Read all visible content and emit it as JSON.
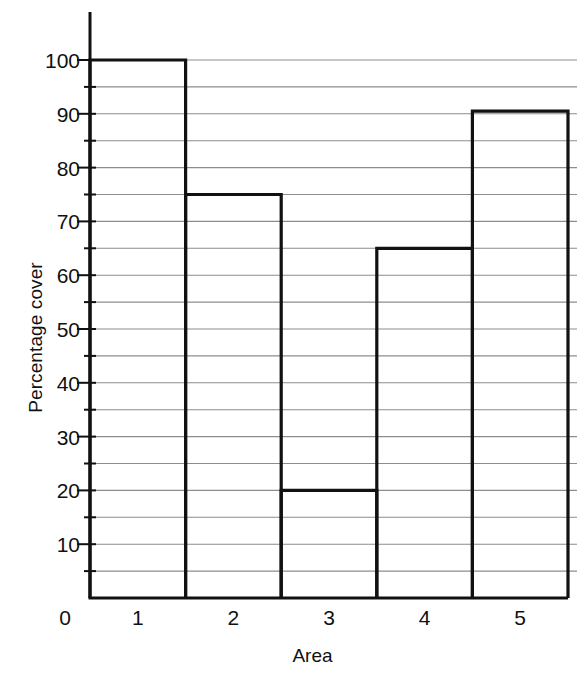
{
  "chart_data": {
    "type": "bar",
    "title": "",
    "subtitle": "",
    "xlabel": "Area",
    "ylabel": "Percentage cover",
    "categories": [
      "1",
      "2",
      "3",
      "4",
      "5"
    ],
    "values": [
      100,
      75,
      20,
      65,
      90.5
    ],
    "series": [
      {
        "name": "Percentage cover",
        "values": [
          100,
          75,
          20,
          65,
          90.5
        ]
      }
    ],
    "ylim": [
      0,
      107
    ],
    "xlim": [
      0.5,
      5.5
    ],
    "y_major_ticks": [
      0,
      10,
      20,
      30,
      40,
      50,
      60,
      70,
      80,
      90,
      100
    ],
    "y_major_tick_labels": [
      "10",
      "20",
      "30",
      "40",
      "50",
      "60",
      "70",
      "80",
      "90",
      "100"
    ],
    "y_minor_ticks": [
      5,
      15,
      25,
      35,
      45,
      55,
      65,
      75,
      85,
      95
    ],
    "y_origin_label": "0",
    "grid": true,
    "grid_interval": 5,
    "grid_axis": "y",
    "legend": false,
    "legend_position": "none",
    "bar_style": "outlined",
    "bar_gap": 0,
    "annotations": []
  },
  "style": {
    "background": "#ffffff",
    "bar_stroke": "#111111",
    "bar_fill": "none",
    "bar_stroke_width": 3.2,
    "grid_color": "#8d8d8d",
    "axis_color": "#111111",
    "text_color": "#111111"
  },
  "geometry": {
    "plot_left": 90,
    "plot_right": 568,
    "grid_right": 577,
    "plot_bottom": 598,
    "y_top_axis": 12,
    "y_value_100": 60,
    "px_per_unit": 5.38
  }
}
